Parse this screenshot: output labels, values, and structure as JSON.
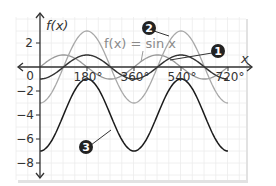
{
  "chart_data": {
    "type": "line",
    "title": "",
    "xlabel": "x",
    "ylabel": "f(x)",
    "x_ticks": [
      "0",
      "180°",
      "360°",
      "540°",
      "720°"
    ],
    "y_ticks": [
      "2",
      "0",
      "−2",
      "−4",
      "−6",
      "−8"
    ],
    "xlim": [
      -80,
      900
    ],
    "ylim": [
      -9,
      3.6
    ],
    "grid": true,
    "annotation": "f(x) = sin x",
    "series": [
      {
        "name": "f(x) = sin x",
        "marker": "",
        "formula": "sin x",
        "color": "#9a9a9a"
      },
      {
        "name": "1",
        "marker": "1",
        "formula": "-cos x",
        "color": "#333333"
      },
      {
        "name": "2",
        "marker": "2",
        "formula": "-3cos x",
        "color": "#a8a8a8"
      },
      {
        "name": "3",
        "marker": "3",
        "formula": "-4 - 3cos x",
        "color": "#1a1a1a"
      }
    ]
  },
  "labels": {
    "fx": "f(x)",
    "x": "x",
    "equation": "f(x) = sin x",
    "badge1": "1",
    "badge2": "2",
    "badge3": "3",
    "t0": "0",
    "t180": "180°",
    "t360": "360°",
    "t540": "540°",
    "t720": "720°",
    "y2": "2",
    "ym2": "−2",
    "ym4": "−4",
    "ym6": "−6",
    "ym8": "−8"
  }
}
